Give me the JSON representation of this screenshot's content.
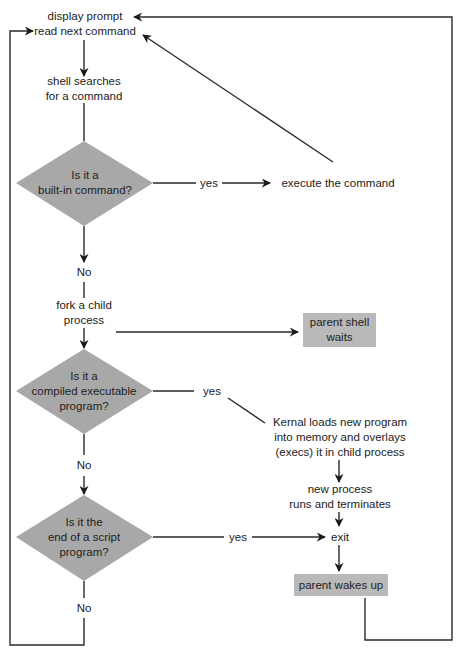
{
  "diagram": {
    "type": "flowchart",
    "colors": {
      "decision_fill": "#a8a8a8",
      "process_box_fill": "#b9b9b9",
      "line": "#222222",
      "background": "#ffffff"
    },
    "nodes": {
      "start": {
        "line1": "display prompt",
        "line2": "read next command"
      },
      "search": {
        "line1": "shell searches",
        "line2": "for a command"
      },
      "decision_builtin": {
        "line1": "Is it a",
        "line2": "built-in command?"
      },
      "execute": {
        "text": "execute the command"
      },
      "fork": {
        "line1": "fork a child",
        "line2": "process"
      },
      "parent_waits": {
        "line1": "parent shell",
        "line2": "waits"
      },
      "decision_compiled": {
        "line1": "Is it a",
        "line2": "compiled executable",
        "line3": "program?"
      },
      "kernel_loads": {
        "line1": "Kernal loads new program",
        "line2": "into memory and overlays",
        "line3": "(execs) it in child process"
      },
      "new_process": {
        "line1": "new process",
        "line2": "runs and terminates"
      },
      "decision_script": {
        "line1": "Is it the",
        "line2": "end of a script",
        "line3": "program?"
      },
      "exit": {
        "text": "exit"
      },
      "parent_wakes": {
        "text": "parent wakes up"
      }
    },
    "edge_labels": {
      "builtin_yes": "yes",
      "builtin_no": "No",
      "compiled_yes": "yes",
      "compiled_no": "No",
      "script_yes": "yes",
      "script_no": "No"
    }
  }
}
